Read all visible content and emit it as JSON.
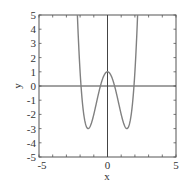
{
  "chart_data": {
    "type": "line",
    "title": "",
    "xlabel": "x",
    "ylabel": "y",
    "xlim": [
      -5,
      5
    ],
    "ylim": [
      -5,
      5
    ],
    "grid": false,
    "legend": null,
    "x_tick_labels": [
      "-5",
      "0",
      "5"
    ],
    "x_ticks_minor_every": 1,
    "y_tick_labels": [
      "-5",
      "-4",
      "-3",
      "-2",
      "-1",
      "0",
      "1",
      "2",
      "3",
      "4",
      "5"
    ],
    "axes_lines_through_origin": true,
    "series": [
      {
        "name": "y = x^4 - 4x^2 + 1",
        "color": "#808080",
        "x": [
          -2.2,
          -2.1,
          -2.0,
          -1.9,
          -1.8,
          -1.7,
          -1.6,
          -1.5,
          -1.414,
          -1.3,
          -1.2,
          -1.1,
          -1.0,
          -0.9,
          -0.8,
          -0.7,
          -0.6,
          -0.5,
          -0.4,
          -0.3,
          -0.2,
          -0.1,
          0.0,
          0.1,
          0.2,
          0.3,
          0.4,
          0.5,
          0.6,
          0.7,
          0.8,
          0.9,
          1.0,
          1.1,
          1.2,
          1.3,
          1.414,
          1.5,
          1.6,
          1.7,
          1.8,
          1.9,
          2.0,
          2.1,
          2.2
        ],
        "y": [
          5.07,
          2.81,
          1.0,
          -0.4,
          -1.46,
          -2.21,
          -2.69,
          -2.94,
          -3.0,
          -2.9,
          -2.68,
          -2.38,
          -2.0,
          -1.58,
          -1.15,
          -0.72,
          -0.31,
          0.06,
          0.38,
          0.65,
          0.84,
          0.96,
          1.0,
          0.96,
          0.84,
          0.65,
          0.38,
          0.06,
          -0.31,
          -0.72,
          -1.15,
          -1.58,
          -2.0,
          -2.38,
          -2.68,
          -2.9,
          -3.0,
          -2.94,
          -2.69,
          -2.21,
          -1.46,
          -0.4,
          1.0,
          2.81,
          5.07
        ]
      }
    ],
    "annotations": {
      "local_max": [
        0,
        1
      ],
      "local_minima": [
        [
          -1.414,
          -3
        ],
        [
          1.414,
          -3
        ]
      ],
      "roots": [
        -1.932,
        -0.518,
        0.518,
        1.932
      ]
    }
  },
  "colors": {
    "frame": "#555555",
    "axes": "#444444",
    "curve": "#808080"
  }
}
